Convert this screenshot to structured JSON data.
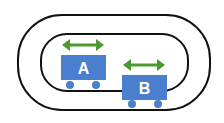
{
  "diagram": {
    "colors": {
      "track": "#111111",
      "cart": "#4a7fd0",
      "arrow": "#4a9a2e",
      "label": "#ffffff"
    },
    "carts": [
      {
        "id": "cart-a",
        "label": "A"
      },
      {
        "id": "cart-b",
        "label": "B"
      }
    ]
  }
}
